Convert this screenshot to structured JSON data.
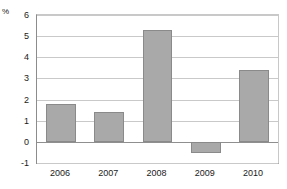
{
  "chart_data": {
    "type": "bar",
    "title": "",
    "subtitle": "",
    "xlabel": "",
    "ylabel": "%",
    "unit_label": "%",
    "categories": [
      "2006",
      "2007",
      "2008",
      "2009",
      "2010"
    ],
    "values": [
      1.8,
      1.4,
      5.3,
      -0.55,
      3.4
    ],
    "series": [
      {
        "name": "",
        "values": [
          1.8,
          1.4,
          5.3,
          -0.55,
          3.4
        ]
      }
    ],
    "ylim": [
      -1,
      6
    ],
    "yticks": [
      6,
      5,
      4,
      3,
      2,
      1,
      0,
      -1
    ],
    "ytick_labels": [
      "6",
      "5",
      "4",
      "3",
      "2",
      "1",
      "0",
      "-1"
    ],
    "grid": true,
    "grid_axis": "y",
    "legend": false,
    "legend_position": "none",
    "bar_fill_color": "#a9a9a9",
    "bar_border_color": "#8a8a8a",
    "gridline_color": "#c9c9c9",
    "axis_color": "#8c8c8c",
    "background_color": "#ffffff",
    "text_color": "#1a1a1a"
  }
}
